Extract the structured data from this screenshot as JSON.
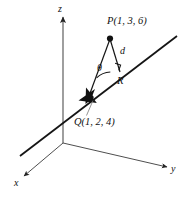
{
  "figure": {
    "kind": "3d-coordinate-diagram",
    "width": 186,
    "height": 198,
    "background_color": "#ffffff"
  },
  "axes": {
    "z": {
      "label": "z",
      "color": "#9a9a9a",
      "direction": "up"
    },
    "x": {
      "label": "x",
      "color": "#333333",
      "direction": "down-left"
    },
    "y": {
      "label": "y",
      "color": "#333333",
      "direction": "down-right"
    },
    "origin_color": "#333333"
  },
  "points": {
    "P": {
      "label": "P(1, 3, 6)",
      "marker": "filled-dot",
      "color": "#111111"
    },
    "Q": {
      "label": "Q(1, 2, 4)",
      "marker": "vector-arrowhead",
      "color": "#111111"
    },
    "R": {
      "label": "R",
      "marker": "none",
      "color": "#111111"
    }
  },
  "segments": {
    "d": {
      "label": "d",
      "meaning": "perpendicular distance from P to the line",
      "color": "#111111"
    },
    "PQ": {
      "label": "",
      "meaning": "segment from P to Q",
      "color": "#111111"
    },
    "line": {
      "label": "",
      "meaning": "line through Q along which R lies",
      "color": "#111111"
    }
  },
  "angle": {
    "label": "θ",
    "vertex": "Q",
    "marker": "arc",
    "color": "#111111"
  },
  "right_angle": {
    "label": "",
    "vertex": "R",
    "marker": "square",
    "color": "#111111"
  }
}
